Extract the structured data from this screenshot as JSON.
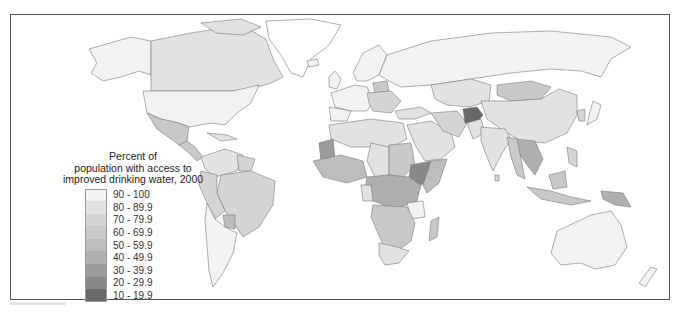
{
  "legend": {
    "title_lines": [
      "Percent of",
      "population with access to",
      "improved drinking water, 2000"
    ],
    "items": [
      {
        "label": "90 - 100",
        "color": "#f2f2f2"
      },
      {
        "label": "80 - 89.9",
        "color": "#e2e2e2"
      },
      {
        "label": "70 - 79.9",
        "color": "#d4d4d4"
      },
      {
        "label": "60 - 69.9",
        "color": "#c8c8c8"
      },
      {
        "label": "50 - 59.9",
        "color": "#bdbdbd"
      },
      {
        "label": "40 - 49.9",
        "color": "#afafaf"
      },
      {
        "label": "30 - 39.9",
        "color": "#9b9b9b"
      },
      {
        "label": "20 - 29.9",
        "color": "#888888"
      },
      {
        "label": "10 - 19.9",
        "color": "#686868"
      }
    ]
  },
  "map": {
    "no_data_color": "#ffffff",
    "border_color": "#7a7a7a"
  }
}
